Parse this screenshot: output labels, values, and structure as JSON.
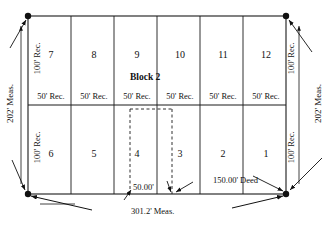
{
  "diagram": {
    "type": "survey-plat",
    "block_label": "Block 2",
    "frontage_label": "50' Rec.",
    "depth_label": "100' Rec.",
    "overall_width_label": "301.2' Meas.",
    "overall_height_label": "202' Meas.",
    "parcel_width_label": "50.00'",
    "parcel_depth_label": "150.00' Deed",
    "top_row_lots": [
      "7",
      "8",
      "9",
      "10",
      "11",
      "12"
    ],
    "bottom_row_lots": [
      "6",
      "5",
      "4",
      "3",
      "2",
      "1"
    ],
    "top_row_frontage": [
      "50' Rec.",
      "50' Rec.",
      "50' Rec.",
      "50' Rec.",
      "50' Rec.",
      "50' Rec."
    ],
    "left_depth_top": "100' Rec.",
    "left_depth_bottom": "100' Rec.",
    "right_depth_top": "100' Rec.",
    "right_depth_bottom": "100' Rec.",
    "left_overall": "202' Meas.",
    "right_overall": "202' Meas.",
    "colors": {
      "line": "#1a1a1a",
      "text": "#111111",
      "background": "#ffffff"
    }
  }
}
